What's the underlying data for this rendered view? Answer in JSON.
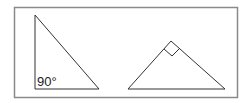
{
  "diagram": {
    "left_triangle": {
      "angle_label": "90°",
      "right_angle_position": "bottom-left"
    },
    "right_triangle": {
      "right_angle_marker": "square at apex"
    },
    "colors": {
      "frame": "#8a8a8a",
      "lines": "#333333",
      "background": "#ffffff"
    }
  }
}
